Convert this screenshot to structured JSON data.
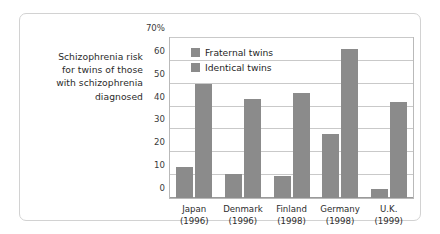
{
  "chart_data": {
    "type": "bar",
    "title": "",
    "caption_lines": [
      "Schizophrenia risk",
      "for twins of those",
      "with schizophrenia",
      "diagnosed"
    ],
    "categories": [
      "Japan",
      "Denmark",
      "Finland",
      "Germany",
      "U.K."
    ],
    "category_years": [
      "(1996)",
      "(1996)",
      "(1998)",
      "(1998)",
      "(1999)"
    ],
    "series": [
      {
        "name": "Fraternal twins",
        "values": [
          13.5,
          10.5,
          9.5,
          28,
          4
        ]
      },
      {
        "name": "Identical twins",
        "values": [
          50,
          43.5,
          46,
          65,
          42
        ]
      }
    ],
    "xlabel": "",
    "ylabel": "",
    "ylim": [
      0,
      70
    ],
    "yticks": [
      0,
      10,
      20,
      30,
      40,
      50,
      60,
      70
    ],
    "ytick_labels": [
      "0",
      "10",
      "20",
      "30",
      "40",
      "50",
      "60",
      "70%"
    ],
    "grid": true,
    "legend_position": "top-left-inside",
    "colors": {
      "bar": "#8b8b8b",
      "gridline": "#c9c9c9",
      "plot_border": "#b9b9b9",
      "figure_border": "#d2d2d2",
      "text": "#2b2b2b",
      "background": "#ffffff"
    }
  }
}
